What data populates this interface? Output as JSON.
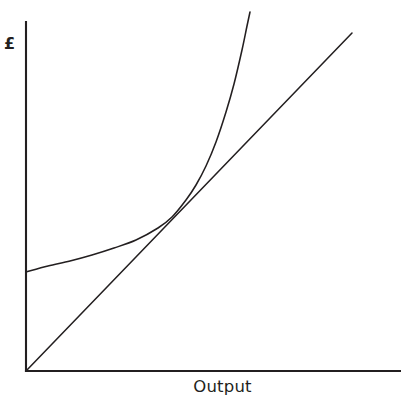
{
  "figure": {
    "background_color": "#ffffff",
    "ink_color": "#231f20",
    "width": 401,
    "height": 405
  },
  "axes": {
    "y_label": "£",
    "x_label": "Output",
    "origin": {
      "x": 26,
      "y": 371
    },
    "y_axis_top": {
      "x": 26,
      "y": 22
    },
    "x_axis_right": {
      "x": 401,
      "y": 371
    }
  },
  "chart_data": {
    "type": "line",
    "title": "",
    "subtitle": "",
    "xlabel": "Output",
    "ylabel": "£",
    "grid": false,
    "legend": null,
    "legend_position": "none",
    "xlim": [
      0,
      100
    ],
    "ylim": [
      0,
      100
    ],
    "x_ticks": [],
    "y_ticks": [],
    "annotations": [],
    "series": [
      {
        "name": "Total cost",
        "shape": "convex-increasing",
        "description": "Rises from a positive fixed-cost intercept on the vertical axis, flat at first then curving steeply upward (exponential-like).",
        "y_intercept_px": 272,
        "points_px": [
          [
            26,
            272
          ],
          [
            48,
            266
          ],
          [
            70,
            261
          ],
          [
            92,
            255
          ],
          [
            114,
            248
          ],
          [
            136,
            240
          ],
          [
            158,
            228
          ],
          [
            172,
            217
          ],
          [
            186,
            200
          ],
          [
            196,
            185
          ],
          [
            206,
            166
          ],
          [
            216,
            142
          ],
          [
            226,
            112
          ],
          [
            234,
            84
          ],
          [
            242,
            50
          ],
          [
            247,
            26
          ],
          [
            250,
            12
          ]
        ],
        "x": [
          0,
          6,
          12,
          18,
          24,
          29,
          35,
          39,
          43,
          45,
          48,
          51,
          53,
          55,
          58,
          59,
          60
        ],
        "y": [
          28,
          30,
          32,
          33,
          35,
          38,
          41,
          44,
          49,
          53,
          59,
          66,
          74,
          82,
          92,
          99,
          103
        ]
      },
      {
        "name": "Total revenue",
        "shape": "linear-through-origin",
        "description": "Straight line from the origin rising at a constant slope to the upper right.",
        "start_px": [
          26,
          371
        ],
        "end_px": [
          352,
          33
        ],
        "x": [
          0,
          87
        ],
        "y": [
          0,
          97
        ]
      }
    ],
    "intersection_px": [
      193,
      189
    ],
    "intersection_note": "Break-even point where total revenue line crosses the total cost curve"
  }
}
